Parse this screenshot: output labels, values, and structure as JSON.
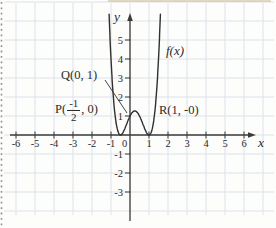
{
  "figure": {
    "background": "#fdfdfc",
    "grid_color": "#dde3ea",
    "axis_color": "#3b3b3b",
    "curve_color": "#303030",
    "text_color": "#2b2b2b",
    "scan_edge_dot_color": "#8f8f8f",
    "scan_top_line_color": "#cdbb92"
  },
  "chart_data": {
    "type": "line",
    "title": "",
    "xlabel": "x",
    "ylabel": "y",
    "origin_label": "0",
    "grid": true,
    "xlim": [
      -6.4,
      6.7
    ],
    "ylim": [
      -4.8,
      6.4
    ],
    "x_ticks": [
      {
        "v": -6,
        "label": "-6"
      },
      {
        "v": -5,
        "label": "-5"
      },
      {
        "v": -4,
        "label": "-4"
      },
      {
        "v": -3,
        "label": "-3"
      },
      {
        "v": -2,
        "label": "-2"
      },
      {
        "v": -1,
        "label": "-1"
      },
      {
        "v": 1,
        "label": "1"
      },
      {
        "v": 2,
        "label": "2"
      },
      {
        "v": 3,
        "label": "3"
      },
      {
        "v": 4,
        "label": "4"
      },
      {
        "v": 5,
        "label": "5"
      },
      {
        "v": 6,
        "label": "6"
      }
    ],
    "y_ticks": [
      {
        "v": 5,
        "label": "5"
      },
      {
        "v": 4,
        "label": "4"
      },
      {
        "v": 3,
        "label": "3"
      },
      {
        "v": 2,
        "label": "2"
      },
      {
        "v": 1,
        "label": "1"
      },
      {
        "v": -1,
        "label": "-1"
      },
      {
        "v": -2,
        "label": "-2"
      },
      {
        "v": -3,
        "label": "-3"
      }
    ],
    "curve": {
      "label": "f(x)",
      "description": "quartic touching x-axis at x=-1/2 and x=1, y-intercept 1",
      "coeffs_desc": [
        4,
        -4,
        -3,
        2,
        1
      ],
      "draw_range": [
        -1.11,
        1.61
      ],
      "key_points": [
        {
          "name": "P",
          "x": -0.5,
          "y": 0
        },
        {
          "name": "Q",
          "x": 0,
          "y": 1
        },
        {
          "name": "R",
          "x": 1,
          "y": 0
        },
        {
          "name": "local-max",
          "x": 0.25,
          "y": 1.27
        }
      ]
    },
    "point_labels": {
      "q": {
        "label": "Q(0, 1)"
      },
      "p": {
        "prefix": "P(",
        "frac_num": "-1",
        "frac_den": "2",
        "suffix": ", 0)"
      },
      "r": {
        "label": "R(1, -0)"
      }
    }
  }
}
